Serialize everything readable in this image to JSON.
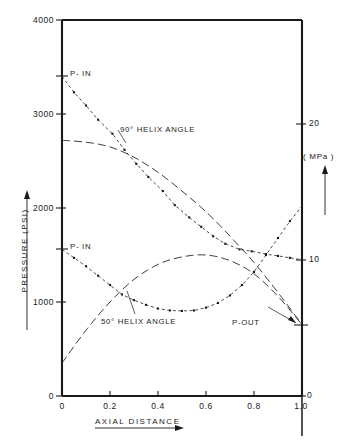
{
  "chart_data": {
    "type": "line",
    "title": "",
    "xlabel": "AXIAL  DISTANCE",
    "ylabel": "PRESSURE  (PSI)",
    "y2label": "( MPa )",
    "xlim": [
      0,
      1.0
    ],
    "ylim": [
      0,
      4000
    ],
    "y2lim": [
      0,
      27.6
    ],
    "grid": false,
    "legend_position": "inline-annotations",
    "xticks": [
      "0",
      "0.2",
      "0.4",
      "0.6",
      "0.8",
      "1.0"
    ],
    "xtick_values": [
      0,
      0.2,
      0.4,
      0.6,
      0.8,
      1.0
    ],
    "yticks": [
      "0",
      "1000",
      "2000",
      "3000",
      "4000"
    ],
    "ytick_values": [
      0,
      1000,
      2000,
      3000,
      4000
    ],
    "y2ticks": [
      "0",
      "10",
      "20"
    ],
    "y2tick_values": [
      0,
      10,
      20
    ],
    "series": [
      {
        "name": "90 deg helix angle - measured",
        "style": "dotted-with-markers",
        "x": [
          0.0,
          0.05,
          0.1,
          0.15,
          0.21,
          0.26,
          0.31,
          0.36,
          0.42,
          0.47,
          0.53,
          0.58,
          0.63,
          0.68,
          0.74,
          0.79,
          0.85,
          0.9,
          0.95,
          1.0
        ],
        "values": [
          3400,
          3230,
          3090,
          2940,
          2790,
          2620,
          2470,
          2330,
          2180,
          2030,
          1900,
          1800,
          1700,
          1620,
          1560,
          1540,
          1510,
          1490,
          1470,
          1450
        ]
      },
      {
        "name": "90 deg helix angle - predicted",
        "style": "dashed",
        "x": [
          0.0,
          0.1,
          0.2,
          0.3,
          0.4,
          0.5,
          0.6,
          0.7,
          0.8,
          0.9,
          1.0
        ],
        "values": [
          2720,
          2700,
          2650,
          2540,
          2380,
          2180,
          1960,
          1700,
          1420,
          1100,
          760
        ]
      },
      {
        "name": "50 deg helix angle - measured",
        "style": "dotted-with-markers",
        "x": [
          0.0,
          0.05,
          0.1,
          0.15,
          0.2,
          0.25,
          0.3,
          0.35,
          0.4,
          0.45,
          0.5,
          0.55,
          0.6,
          0.65,
          0.7,
          0.75,
          0.8,
          0.85,
          0.9,
          0.95,
          1.0
        ],
        "values": [
          1560,
          1470,
          1380,
          1280,
          1180,
          1080,
          1020,
          970,
          930,
          910,
          905,
          910,
          940,
          990,
          1070,
          1180,
          1320,
          1500,
          1680,
          1860,
          2020
        ]
      },
      {
        "name": "50 deg helix angle - predicted",
        "style": "dashed",
        "x": [
          0.0,
          0.1,
          0.2,
          0.3,
          0.4,
          0.5,
          0.6,
          0.7,
          0.8,
          0.9,
          1.0
        ],
        "values": [
          350,
          700,
          1000,
          1240,
          1400,
          1480,
          1500,
          1440,
          1300,
          1060,
          760
        ]
      }
    ],
    "annotations": [
      {
        "text": "P- IN",
        "x": 0.0,
        "y": 3400,
        "note": "upper inlet pressure for 90 deg curve"
      },
      {
        "text": "P- IN",
        "x": 0.0,
        "y": 1560,
        "note": "lower inlet pressure for 50 deg curve"
      },
      {
        "text": "P-OUT",
        "x": 1.0,
        "y": 760,
        "note": "common outlet pressure"
      },
      {
        "text": "90° HELIX  ANGLE",
        "x": 0.27,
        "y": 2600,
        "note": "curve label"
      },
      {
        "text": "50° HELIX  ANGLE",
        "x": 0.32,
        "y": 840,
        "note": "curve label"
      }
    ]
  },
  "axes": {
    "y_left_title": "PRESSURE  (PSI)",
    "y_right_title": "( MPa )",
    "x_title": "AXIAL  DISTANCE"
  },
  "labels": {
    "p_in_upper": "P- IN",
    "p_in_lower": "P- IN",
    "p_out": "P-OUT",
    "helix90": "90° HELIX  ANGLE",
    "helix50": "50° HELIX  ANGLE",
    "y_tick_0": "0",
    "y_tick_1000": "1000",
    "y_tick_2000": "2000",
    "y_tick_3000": "3000",
    "y_tick_4000": "4000",
    "x_tick_0": "0",
    "x_tick_02": "0.2",
    "x_tick_04": "0.4",
    "x_tick_06": "0.6",
    "x_tick_08": "0.8",
    "x_tick_10": "1.0",
    "r_tick_0": "0",
    "r_tick_10": "10",
    "r_tick_20": "20"
  },
  "colors": {
    "ink": "#1a1a1a",
    "background": "#ffffff"
  }
}
